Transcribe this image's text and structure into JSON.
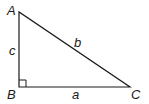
{
  "diagram": {
    "type": "right-triangle",
    "vertices": {
      "A": {
        "label": "A",
        "x": 19,
        "y": 12
      },
      "B": {
        "label": "B",
        "x": 19,
        "y": 87
      },
      "C": {
        "label": "C",
        "x": 130,
        "y": 87
      }
    },
    "sides": {
      "a": {
        "label": "a",
        "from": "B",
        "to": "C"
      },
      "b": {
        "label": "b",
        "from": "A",
        "to": "C"
      },
      "c": {
        "label": "c",
        "from": "A",
        "to": "B"
      }
    },
    "right_angle_at": "B",
    "stroke_color": "#1a1a1a"
  }
}
